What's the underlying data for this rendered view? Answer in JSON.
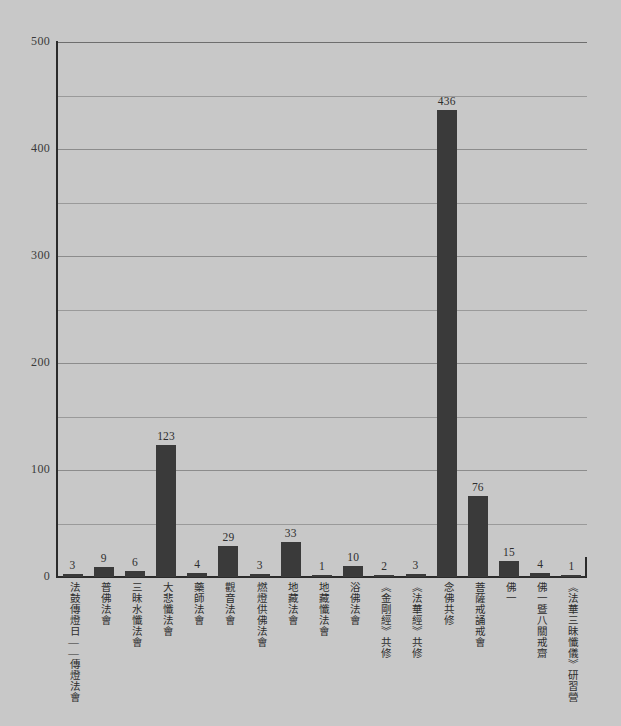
{
  "chart_data": {
    "type": "bar",
    "title": "",
    "subtitle": "",
    "xlabel": "",
    "ylabel": "",
    "ylim": [
      0,
      500
    ],
    "y_major_ticks": [
      0,
      100,
      200,
      300,
      400,
      500
    ],
    "y_minor_step": 50,
    "grid": true,
    "grid_axis": "y",
    "legend": "none",
    "orientation": "vertical",
    "bar_color": "#3a3a3a",
    "background_color": "#c8c8c8",
    "axis_color": "#2b2b2b",
    "gridline_color": "#9a9a9a",
    "value_labels": true,
    "categories": [
      "法鼓傳燈日——傳燈法會",
      "普佛法會",
      "三昧水懺法會",
      "大悲懺法會",
      "藥師法會",
      "觀音法會",
      "燃燈供佛法會",
      "地藏法會",
      "地藏懺法會",
      "浴佛法會",
      "《金剛經》共修",
      "《法華經》共修",
      "念佛共修",
      "菩薩戒誦戒會",
      "佛一",
      "佛一暨八關戒齋",
      "《法華三昧懺儀》研習營"
    ],
    "values": [
      3,
      9,
      6,
      123,
      4,
      29,
      3,
      33,
      1,
      10,
      2,
      3,
      436,
      76,
      15,
      4,
      1
    ]
  }
}
